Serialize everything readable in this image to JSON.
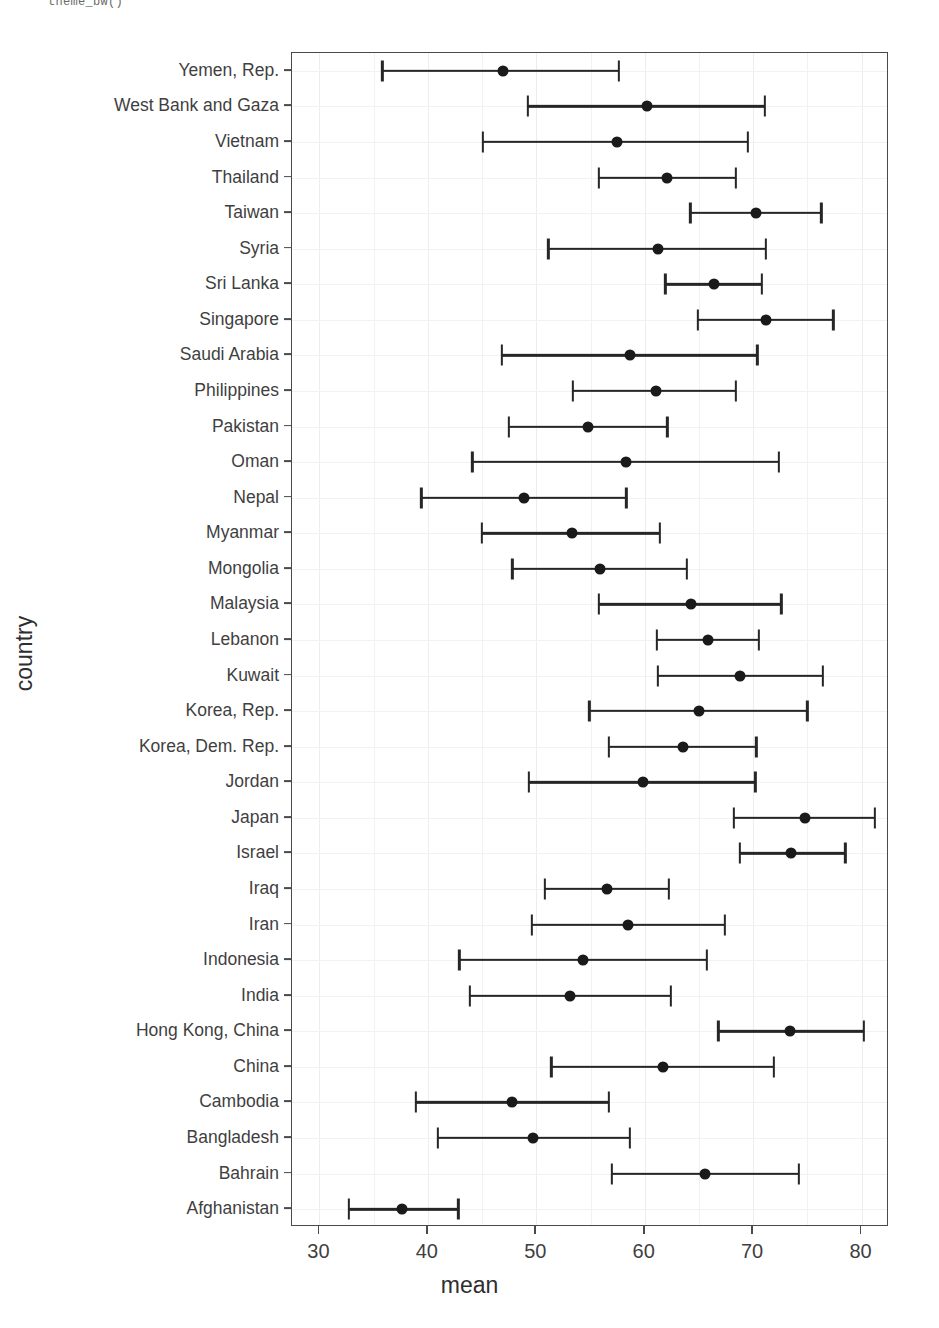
{
  "code_fragment": "theme_bw()",
  "chart_data": {
    "type": "scatter",
    "subtype": "dot-plot-with-error-bars",
    "title": "",
    "xlabel": "mean",
    "ylabel": "country",
    "xlim": [
      30,
      80
    ],
    "xticks": [
      30,
      40,
      50,
      60,
      70,
      80
    ],
    "grid": true,
    "legend": null,
    "orientation": "horizontal",
    "categories": [
      "Yemen, Rep.",
      "West Bank and Gaza",
      "Vietnam",
      "Thailand",
      "Taiwan",
      "Syria",
      "Sri Lanka",
      "Singapore",
      "Saudi Arabia",
      "Philippines",
      "Pakistan",
      "Oman",
      "Nepal",
      "Myanmar",
      "Mongolia",
      "Malaysia",
      "Lebanon",
      "Kuwait",
      "Korea, Rep.",
      "Korea, Dem. Rep.",
      "Jordan",
      "Japan",
      "Israel",
      "Iraq",
      "Iran",
      "Indonesia",
      "India",
      "Hong Kong, China",
      "China",
      "Cambodia",
      "Bangladesh",
      "Bahrain",
      "Afghanistan"
    ],
    "points": [
      {
        "country": "Yemen, Rep.",
        "mean": 46.9,
        "low": 35.8,
        "high": 57.6
      },
      {
        "country": "West Bank and Gaza",
        "mean": 60.2,
        "low": 49.2,
        "high": 71.1
      },
      {
        "country": "Vietnam",
        "mean": 57.4,
        "low": 45.1,
        "high": 69.5
      },
      {
        "country": "Thailand",
        "mean": 62.1,
        "low": 55.8,
        "high": 68.4
      },
      {
        "country": "Taiwan",
        "mean": 70.3,
        "low": 64.2,
        "high": 76.3
      },
      {
        "country": "Syria",
        "mean": 61.2,
        "low": 51.1,
        "high": 71.2
      },
      {
        "country": "Sri Lanka",
        "mean": 66.4,
        "low": 61.9,
        "high": 70.8
      },
      {
        "country": "Singapore",
        "mean": 71.2,
        "low": 64.9,
        "high": 77.4
      },
      {
        "country": "Saudi Arabia",
        "mean": 58.6,
        "low": 46.8,
        "high": 70.4
      },
      {
        "country": "Philippines",
        "mean": 61.0,
        "low": 53.4,
        "high": 68.4
      },
      {
        "country": "Pakistan",
        "mean": 54.8,
        "low": 47.5,
        "high": 62.1
      },
      {
        "country": "Oman",
        "mean": 58.3,
        "low": 44.1,
        "high": 72.4
      },
      {
        "country": "Nepal",
        "mean": 48.9,
        "low": 39.4,
        "high": 58.3
      },
      {
        "country": "Myanmar",
        "mean": 53.3,
        "low": 45.0,
        "high": 61.4
      },
      {
        "country": "Mongolia",
        "mean": 55.9,
        "low": 47.8,
        "high": 63.9
      },
      {
        "country": "Malaysia",
        "mean": 64.3,
        "low": 55.8,
        "high": 72.6
      },
      {
        "country": "Lebanon",
        "mean": 65.8,
        "low": 61.1,
        "high": 70.5
      },
      {
        "country": "Kuwait",
        "mean": 68.8,
        "low": 61.2,
        "high": 76.4
      },
      {
        "country": "Korea, Rep.",
        "mean": 65.0,
        "low": 54.9,
        "high": 75.0
      },
      {
        "country": "Korea, Dem. Rep.",
        "mean": 63.5,
        "low": 56.7,
        "high": 70.3
      },
      {
        "country": "Jordan",
        "mean": 59.8,
        "low": 49.3,
        "high": 70.2
      },
      {
        "country": "Japan",
        "mean": 74.8,
        "low": 68.2,
        "high": 81.2
      },
      {
        "country": "Israel",
        "mean": 73.5,
        "low": 68.8,
        "high": 78.5
      },
      {
        "country": "Iraq",
        "mean": 56.5,
        "low": 50.8,
        "high": 62.2
      },
      {
        "country": "Iran",
        "mean": 58.5,
        "low": 49.6,
        "high": 67.4
      },
      {
        "country": "Indonesia",
        "mean": 54.3,
        "low": 42.9,
        "high": 65.7
      },
      {
        "country": "India",
        "mean": 53.1,
        "low": 43.9,
        "high": 62.4
      },
      {
        "country": "Hong Kong, China",
        "mean": 73.4,
        "low": 66.8,
        "high": 80.2
      },
      {
        "country": "China",
        "mean": 61.7,
        "low": 51.4,
        "high": 71.9
      },
      {
        "country": "Cambodia",
        "mean": 47.8,
        "low": 38.9,
        "high": 56.7
      },
      {
        "country": "Bangladesh",
        "mean": 49.7,
        "low": 40.9,
        "high": 58.6
      },
      {
        "country": "Bahrain",
        "mean": 65.6,
        "low": 57.0,
        "high": 74.2
      },
      {
        "country": "Afghanistan",
        "mean": 37.6,
        "low": 32.7,
        "high": 42.8
      }
    ]
  },
  "colors": {
    "point": "#1a1a1a",
    "errorbar": "#262626",
    "panel_border": "#4a4a4a",
    "grid": "#f2f2f2",
    "text": "#3f3f3f",
    "background": "#ffffff"
  }
}
